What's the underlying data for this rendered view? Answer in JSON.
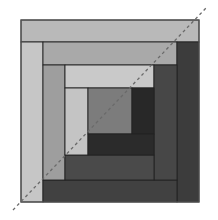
{
  "diagram": {
    "type": "log-cabin-quilt-block",
    "outer_border_color": "#555555",
    "seam_color": "#222222",
    "pieces": [
      {
        "name": "strip-top-1",
        "x": 21,
        "y": 20,
        "w": 178,
        "h": 22,
        "fill": "#b9b9b9"
      },
      {
        "name": "strip-left-1",
        "x": 21,
        "y": 42,
        "w": 22,
        "h": 160,
        "fill": "#c6c6c6"
      },
      {
        "name": "strip-top-2",
        "x": 43,
        "y": 42,
        "w": 134,
        "h": 23,
        "fill": "#a9a9a9"
      },
      {
        "name": "strip-right-1",
        "x": 177,
        "y": 42,
        "w": 22,
        "h": 160,
        "fill": "#3c3c3c"
      },
      {
        "name": "strip-bottom-1",
        "x": 43,
        "y": 180,
        "w": 134,
        "h": 22,
        "fill": "#414141"
      },
      {
        "name": "strip-left-2",
        "x": 43,
        "y": 65,
        "w": 22,
        "h": 115,
        "fill": "#9e9e9e"
      },
      {
        "name": "strip-top-3",
        "x": 65,
        "y": 65,
        "w": 89,
        "h": 23,
        "fill": "#c9c9c9"
      },
      {
        "name": "strip-right-2",
        "x": 154,
        "y": 65,
        "w": 23,
        "h": 115,
        "fill": "#474747"
      },
      {
        "name": "strip-bottom-2",
        "x": 65,
        "y": 155,
        "w": 89,
        "h": 25,
        "fill": "#4a4a4a"
      },
      {
        "name": "strip-left-3",
        "x": 65,
        "y": 88,
        "w": 23,
        "h": 67,
        "fill": "#c4c4c4"
      },
      {
        "name": "center-square",
        "x": 88,
        "y": 88,
        "w": 44,
        "h": 46,
        "fill": "#7c7c7c"
      },
      {
        "name": "strip-right-3",
        "x": 132,
        "y": 88,
        "w": 22,
        "h": 46,
        "fill": "#282828"
      },
      {
        "name": "strip-bottom-3",
        "x": 88,
        "y": 134,
        "w": 66,
        "h": 21,
        "fill": "#2b2b2b"
      }
    ],
    "diagonal": {
      "x1": 13,
      "y1": 210,
      "x2": 206,
      "y2": 8,
      "stroke": "#6a6a6a",
      "dash": "3,3",
      "width": 1.3
    }
  }
}
